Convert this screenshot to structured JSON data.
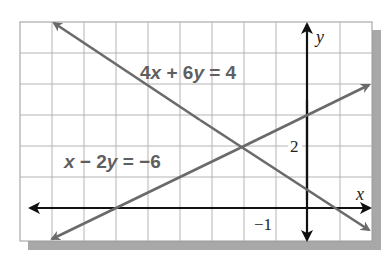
{
  "graph": {
    "equations": [
      {
        "id": "line1",
        "label": "4x + 6y = 4",
        "parts": [
          "4",
          "x",
          " + 6",
          "y",
          " = 4"
        ],
        "color": "#6a6a6a"
      },
      {
        "id": "line2",
        "label": "x − 2y = −6",
        "parts": [
          "x",
          " − 2",
          "y",
          " = −6"
        ],
        "color": "#6a6a6a"
      }
    ],
    "axes": {
      "x_label": "x",
      "y_label": "y",
      "x_tick_label": "−1",
      "y_tick_label": "2"
    },
    "intersection": {
      "x": -2,
      "y": 2
    },
    "grid": {
      "x_range": [
        -9,
        2
      ],
      "y_range": [
        -1,
        6
      ],
      "step": 1
    },
    "colors": {
      "grid": "#b4b4b4",
      "axis": "#111111",
      "line": "#6a6a6a",
      "shadow": "#a8a8a8",
      "frame": "#9a9a9a"
    }
  }
}
